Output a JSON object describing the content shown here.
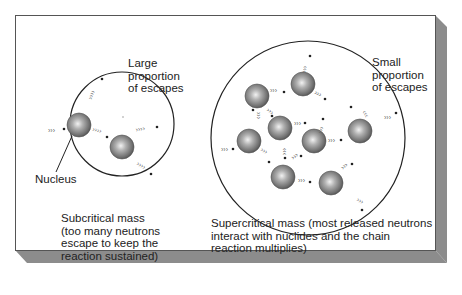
{
  "figure": {
    "frame_color": "#555555",
    "shadow_color": "#8c8c8c",
    "background": "#ffffff"
  },
  "subcritical": {
    "annotation": "Large\nproportion\nof escapes",
    "nucleus_label": "Nucleus",
    "caption": "Subcritical mass\n(too many neutrons\nescape to keep the\nreaction sustained)",
    "circle": {
      "cx": 122,
      "cy": 124,
      "r": 52
    },
    "nuclei": [
      {
        "cx": 79,
        "cy": 125,
        "r": 12
      },
      {
        "cx": 122,
        "cy": 147,
        "r": 12
      }
    ],
    "neutron_paths": [
      {
        "x1": 100,
        "y1": 78,
        "x2": 102,
        "y2": 79,
        "dot": [
          102,
          79
        ]
      },
      {
        "x1": 36,
        "y1": 130,
        "x2": 63,
        "y2": 129,
        "dot": [
          64,
          129
        ]
      },
      {
        "x1": 91,
        "y1": 129,
        "x2": 106,
        "y2": 136,
        "dot": [
          107,
          136
        ]
      },
      {
        "x1": 136,
        "y1": 130,
        "x2": 155,
        "y2": 127,
        "dot": [
          157,
          127
        ]
      },
      {
        "x1": 135,
        "y1": 162,
        "x2": 150,
        "y2": 172,
        "dot": [
          151,
          174
        ]
      }
    ]
  },
  "supercritical": {
    "annotation": "Small\nproportion\nof escapes",
    "caption": "Supercritical mass (most released neutrons\ninteract with nuclides and the chain\nreaction multiplies)",
    "circle": {
      "cx": 308,
      "cy": 138,
      "r": 97
    },
    "nuclei": [
      {
        "cx": 257,
        "cy": 96,
        "r": 12
      },
      {
        "cx": 303,
        "cy": 84,
        "r": 12
      },
      {
        "cx": 249,
        "cy": 141,
        "r": 12
      },
      {
        "cx": 280,
        "cy": 128,
        "r": 12
      },
      {
        "cx": 314,
        "cy": 141,
        "r": 12
      },
      {
        "cx": 360,
        "cy": 131,
        "r": 12
      },
      {
        "cx": 283,
        "cy": 177,
        "r": 12
      },
      {
        "cx": 331,
        "cy": 183,
        "r": 12
      }
    ]
  }
}
